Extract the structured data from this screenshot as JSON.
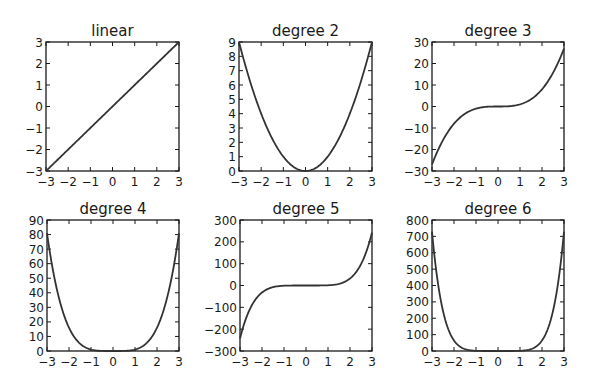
{
  "figure": {
    "width": 591,
    "height": 392,
    "background": "#ffffff",
    "line_color": "#333333"
  },
  "chart_data": [
    {
      "type": "line",
      "title": "linear",
      "function": "x",
      "xlabel": "",
      "ylabel": "",
      "xlim": [
        -3,
        3
      ],
      "ylim": [
        -3,
        3
      ],
      "xticks": [
        -3,
        -2,
        -1,
        0,
        1,
        2,
        3
      ],
      "yticks": [
        -3,
        -2,
        -1,
        0,
        1,
        2,
        3
      ],
      "x": [
        -3,
        -2,
        -1,
        0,
        1,
        2,
        3
      ],
      "y": [
        -3,
        -2,
        -1,
        0,
        1,
        2,
        3
      ],
      "box": [
        46,
        42,
        179,
        171
      ]
    },
    {
      "type": "line",
      "title": "degree 2",
      "function": "x^2",
      "xlabel": "",
      "ylabel": "",
      "xlim": [
        -3,
        3
      ],
      "ylim": [
        0,
        9
      ],
      "xticks": [
        -3,
        -2,
        -1,
        0,
        1,
        2,
        3
      ],
      "yticks": [
        0,
        1,
        2,
        3,
        4,
        5,
        6,
        7,
        8,
        9
      ],
      "x": [
        -3,
        -2,
        -1,
        0,
        1,
        2,
        3
      ],
      "y": [
        9,
        4,
        1,
        0,
        1,
        4,
        9
      ],
      "box": [
        239,
        42,
        372,
        171
      ]
    },
    {
      "type": "line",
      "title": "degree 3",
      "function": "x^3",
      "xlabel": "",
      "ylabel": "",
      "xlim": [
        -3,
        3
      ],
      "ylim": [
        -30,
        30
      ],
      "xticks": [
        -3,
        -2,
        -1,
        0,
        1,
        2,
        3
      ],
      "yticks": [
        -30,
        -20,
        -10,
        0,
        10,
        20,
        30
      ],
      "x": [
        -3,
        -2,
        -1,
        0,
        1,
        2,
        3
      ],
      "y": [
        -27,
        -8,
        -1,
        0,
        1,
        8,
        27
      ],
      "box": [
        432,
        42,
        564,
        171
      ]
    },
    {
      "type": "line",
      "title": "degree 4",
      "function": "x^4",
      "xlabel": "",
      "ylabel": "",
      "xlim": [
        -3,
        3
      ],
      "ylim": [
        0,
        90
      ],
      "xticks": [
        -3,
        -2,
        -1,
        0,
        1,
        2,
        3
      ],
      "yticks": [
        0,
        10,
        20,
        30,
        40,
        50,
        60,
        70,
        80,
        90
      ],
      "x": [
        -3,
        -2,
        -1,
        0,
        1,
        2,
        3
      ],
      "y": [
        81,
        16,
        1,
        0,
        1,
        16,
        81
      ],
      "box": [
        47,
        220,
        179,
        351
      ]
    },
    {
      "type": "line",
      "title": "degree 5",
      "function": "x^5",
      "xlabel": "",
      "ylabel": "",
      "xlim": [
        -3,
        3
      ],
      "ylim": [
        -300,
        300
      ],
      "xticks": [
        -3,
        -2,
        -1,
        0,
        1,
        2,
        3
      ],
      "yticks": [
        -300,
        -200,
        -100,
        0,
        100,
        200,
        300
      ],
      "x": [
        -3,
        -2,
        -1,
        0,
        1,
        2,
        3
      ],
      "y": [
        -243,
        -32,
        -1,
        0,
        1,
        32,
        243
      ],
      "box": [
        240,
        220,
        372,
        351
      ]
    },
    {
      "type": "line",
      "title": "degree 6",
      "function": "x^6",
      "xlabel": "",
      "ylabel": "",
      "xlim": [
        -3,
        3
      ],
      "ylim": [
        0,
        800
      ],
      "xticks": [
        -3,
        -2,
        -1,
        0,
        1,
        2,
        3
      ],
      "yticks": [
        0,
        100,
        200,
        300,
        400,
        500,
        600,
        700,
        800
      ],
      "x": [
        -3,
        -2,
        -1,
        0,
        1,
        2,
        3
      ],
      "y": [
        729,
        64,
        1,
        0,
        1,
        64,
        729
      ],
      "box": [
        432,
        220,
        564,
        351
      ]
    }
  ]
}
